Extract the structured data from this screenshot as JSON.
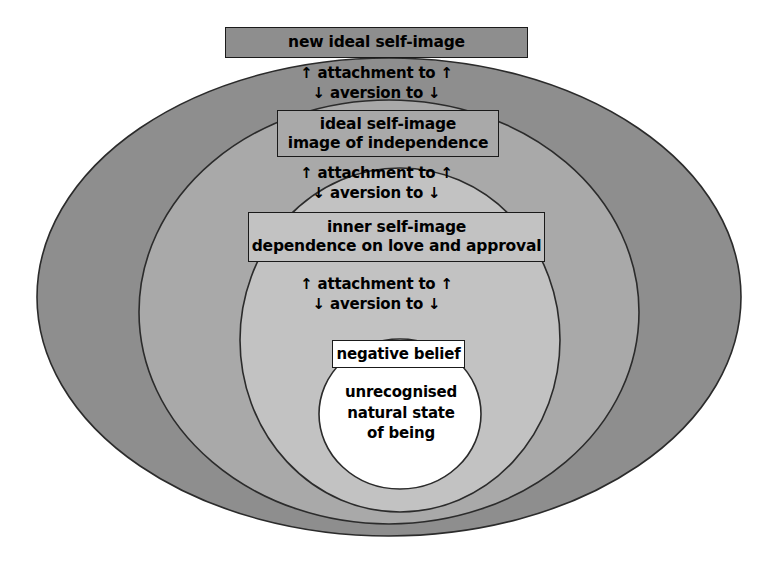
{
  "diagram": {
    "canvas": {
      "width": 778,
      "height": 568,
      "background": "#ffffff"
    },
    "rings": [
      {
        "name": "new-ideal-self-image-ring",
        "fill": "#8e8e8e",
        "stroke": "#2b2b2b",
        "cx": 389,
        "cy": 297,
        "rx": 352,
        "ry": 239
      },
      {
        "name": "ideal-self-image-ring",
        "fill": "#a9a9a9",
        "stroke": "#2b2b2b",
        "cx": 389,
        "cy": 312,
        "rx": 250,
        "ry": 212
      },
      {
        "name": "inner-self-image-ring",
        "fill": "#c2c2c2",
        "stroke": "#2b2b2b",
        "cx": 400,
        "cy": 340,
        "rx": 160,
        "ry": 172
      },
      {
        "name": "natural-state-core",
        "fill": "#ffffff",
        "stroke": "#2b2b2b",
        "cx": 400,
        "cy": 414,
        "rx": 81,
        "ry": 75
      }
    ],
    "boxes": {
      "new_ideal": {
        "lines": [
          "new ideal self-image"
        ],
        "fill": "#8e8e8e"
      },
      "ideal": {
        "lines": [
          "ideal self-image",
          "image of independence"
        ],
        "fill": "#a9a9a9"
      },
      "inner": {
        "lines": [
          "inner self-image",
          "dependence on love and approval"
        ],
        "fill": "#c2c2c2"
      },
      "negative": {
        "lines": [
          "negative belief"
        ],
        "fill": "#ffffff"
      }
    },
    "core_text": {
      "lines": [
        "unrecognised",
        "natural state",
        "of being"
      ]
    },
    "arrow_labels": {
      "up": "↑ attachment to ↑",
      "down": "↓ aversion to ↓"
    }
  }
}
